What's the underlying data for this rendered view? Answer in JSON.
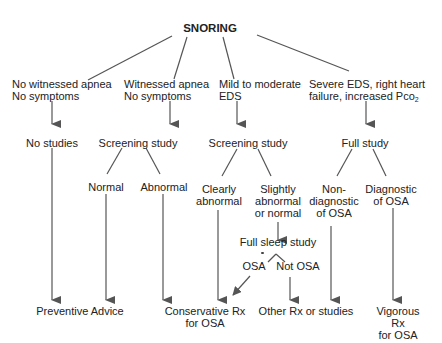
{
  "diagram": {
    "title": "SNORING",
    "level1": [
      {
        "id": "no-apnea",
        "line1": "No witnessed apnea",
        "line2": "No symptoms"
      },
      {
        "id": "witnessed-apnea",
        "line1": "Witnessed apnea",
        "line2": "No symptoms"
      },
      {
        "id": "mild-eds",
        "line1": "Mild to moderate",
        "line2": "EDS"
      },
      {
        "id": "severe-eds",
        "line1": "Severe EDS, right heart",
        "line2": "failure, increased Pco",
        "line2_sub": "2"
      }
    ],
    "level2": {
      "no_studies": "No studies",
      "screening_study_1": "Screening study",
      "screening_study_2": "Screening study",
      "full_study": "Full study"
    },
    "level3": {
      "normal": "Normal",
      "abnormal": "Abnormal",
      "clearly_abnormal": "Clearly\nabnormal",
      "slightly_abnormal": "Slightly\nabnormal\nor normal",
      "non_diagnostic": "Non-\ndiagnostic\nof OSA",
      "diagnostic": "Diagnostic\nof OSA"
    },
    "level4": {
      "full_sleep_study": "Full sleep study",
      "osa": "OSA",
      "not_osa": "Not OSA"
    },
    "outcomes": {
      "preventive_advice": "Preventive Advice",
      "conservative_rx": "Conservative Rx\nfor OSA",
      "other_rx": "Other Rx or studies",
      "vigorous_rx": "Vigorous Rx\nfor OSA"
    },
    "colors": {
      "line": "#555555",
      "text": "#222222",
      "background": "#ffffff"
    }
  }
}
